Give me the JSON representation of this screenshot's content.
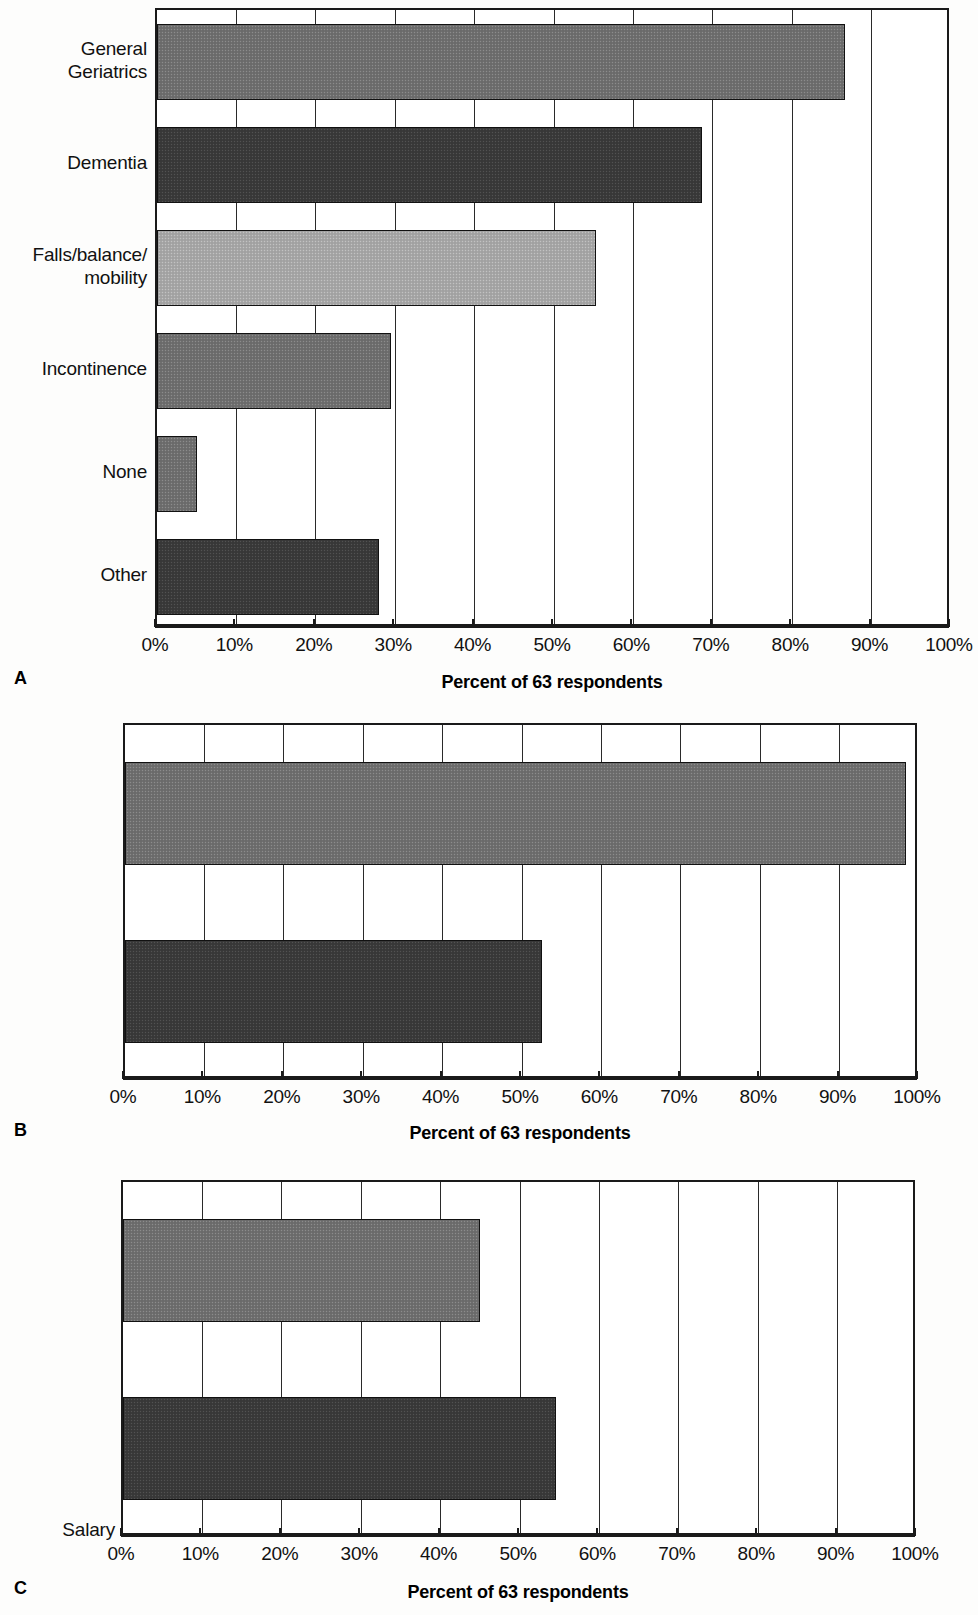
{
  "figure": {
    "axis_title": "Percent of 63 respondents",
    "tick_labels": [
      "0%",
      "10%",
      "20%",
      "30%",
      "40%",
      "50%",
      "60%",
      "70%",
      "80%",
      "90%",
      "100%"
    ],
    "colors": {
      "tone_light": "#a7a7a7",
      "tone_mid": "#6f6f6f",
      "tone_dark": "#3a3a3a",
      "line": "#1a1a1a",
      "background": "#ffffff"
    }
  },
  "panels": [
    {
      "letter": "A",
      "axis_title": "Percent of 63 respondents",
      "categories": [
        "General\nGeriatrics",
        "Dementia",
        "Falls/balance/\nmobility",
        "Incontinence",
        "None",
        "Other"
      ],
      "values": [
        86.6,
        68.6,
        55.3,
        29.5,
        5.0,
        28.0
      ],
      "tones": [
        "mid",
        "dark",
        "light",
        "mid",
        "mid",
        "dark"
      ]
    },
    {
      "letter": "B",
      "axis_title": "Percent of 63 respondents",
      "categories": [
        "Salary",
        "Fee for\nservice"
      ],
      "values": [
        98.4,
        52.5
      ],
      "tones": [
        "mid",
        "dark"
      ]
    },
    {
      "letter": "C",
      "axis_title": "Percent of 63 respondents",
      "categories": [
        "Yes",
        "No"
      ],
      "values": [
        45.0,
        54.5
      ],
      "tones": [
        "mid",
        "dark"
      ]
    }
  ],
  "chart_data": [
    {
      "type": "bar",
      "orientation": "horizontal",
      "panel": "A",
      "title": "",
      "categories": [
        "General Geriatrics",
        "Dementia",
        "Falls/balance/mobility",
        "Incontinence",
        "None",
        "Other"
      ],
      "values": [
        86.6,
        68.6,
        55.3,
        29.5,
        5.0,
        28.0
      ],
      "xlabel": "Percent of 63 respondents",
      "ylabel": "",
      "xlim": [
        0,
        100
      ],
      "xticks": [
        0,
        10,
        20,
        30,
        40,
        50,
        60,
        70,
        80,
        90,
        100
      ],
      "xtick_labels": [
        "0%",
        "10%",
        "20%",
        "30%",
        "40%",
        "50%",
        "60%",
        "70%",
        "80%",
        "90%",
        "100%"
      ],
      "grid": "vertical",
      "legend": "none"
    },
    {
      "type": "bar",
      "orientation": "horizontal",
      "panel": "B",
      "title": "",
      "categories": [
        "Salary",
        "Fee for service"
      ],
      "values": [
        98.4,
        52.5
      ],
      "xlabel": "Percent of 63 respondents",
      "ylabel": "",
      "xlim": [
        0,
        100
      ],
      "xticks": [
        0,
        10,
        20,
        30,
        40,
        50,
        60,
        70,
        80,
        90,
        100
      ],
      "xtick_labels": [
        "0%",
        "10%",
        "20%",
        "30%",
        "40%",
        "50%",
        "60%",
        "70%",
        "80%",
        "90%",
        "100%"
      ],
      "grid": "vertical",
      "legend": "none"
    },
    {
      "type": "bar",
      "orientation": "horizontal",
      "panel": "C",
      "title": "",
      "categories": [
        "Yes",
        "No"
      ],
      "values": [
        45.0,
        54.5
      ],
      "xlabel": "Percent of 63 respondents",
      "ylabel": "",
      "xlim": [
        0,
        100
      ],
      "xticks": [
        0,
        10,
        20,
        30,
        40,
        50,
        60,
        70,
        80,
        90,
        100
      ],
      "xtick_labels": [
        "0%",
        "10%",
        "20%",
        "30%",
        "40%",
        "50%",
        "60%",
        "70%",
        "80%",
        "90%",
        "100%"
      ],
      "grid": "vertical",
      "legend": "none"
    }
  ]
}
